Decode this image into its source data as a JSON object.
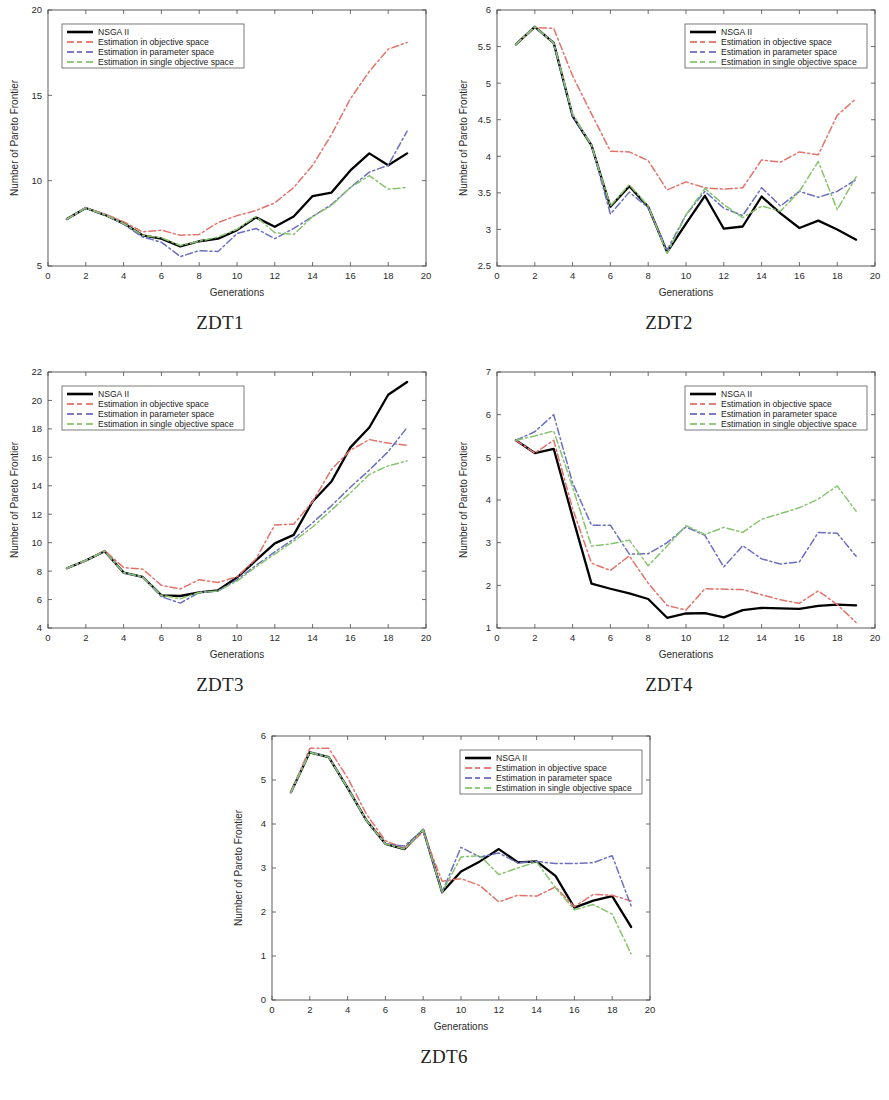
{
  "figure": {
    "axis_label_x": "Generations",
    "axis_label_y": "Number of Pareto Frontier",
    "colors": {
      "nsga2": "#000000",
      "objective": "#e2736b",
      "parameter": "#6b6fc0",
      "single_objective": "#87c46f"
    },
    "legend_entries": [
      "NSGA II",
      "Estimation in objective space",
      "Estimation in parameter space",
      "Estimation in single objective space"
    ]
  },
  "panels": [
    {
      "caption": "ZDT1"
    },
    {
      "caption": "ZDT2"
    },
    {
      "caption": "ZDT3"
    },
    {
      "caption": "ZDT4"
    },
    {
      "caption": "ZDT6"
    }
  ],
  "chart_data": [
    {
      "type": "line",
      "title": "ZDT1",
      "xlabel": "Generations",
      "ylabel": "Number of Pareto Frontier",
      "xlim": [
        0,
        20
      ],
      "ylim": [
        5,
        20
      ],
      "xticks": [
        0,
        2,
        4,
        6,
        8,
        10,
        12,
        14,
        16,
        18,
        20
      ],
      "yticks": [
        5,
        10,
        15,
        20
      ],
      "grid": false,
      "legend_position": "upper-left",
      "x": [
        1,
        2,
        3,
        4,
        5,
        6,
        7,
        8,
        9,
        10,
        11,
        12,
        13,
        14,
        15,
        16,
        17,
        18,
        19
      ],
      "series": [
        {
          "name": "NSGA II",
          "color": "#000000",
          "values": [
            7.75,
            8.4,
            8.0,
            7.5,
            6.8,
            6.6,
            6.15,
            6.45,
            6.6,
            7.1,
            7.85,
            7.3,
            7.9,
            9.1,
            9.3,
            10.6,
            11.6,
            10.9,
            11.6
          ]
        },
        {
          "name": "Estimation in objective space",
          "color": "#e2736b",
          "values": [
            7.75,
            8.4,
            8.05,
            7.6,
            7.0,
            7.1,
            6.8,
            6.85,
            7.55,
            7.95,
            8.25,
            8.7,
            9.6,
            10.9,
            12.7,
            14.8,
            16.4,
            17.7,
            18.1
          ]
        },
        {
          "name": "Estimation in parameter space",
          "color": "#6b6fc0",
          "values": [
            7.75,
            8.4,
            8.0,
            7.45,
            6.7,
            6.4,
            5.55,
            5.9,
            5.85,
            6.9,
            7.2,
            6.6,
            7.2,
            7.9,
            8.6,
            9.6,
            10.5,
            10.9,
            12.9
          ]
        },
        {
          "name": "Estimation in single objective space",
          "color": "#87c46f",
          "values": [
            7.75,
            8.4,
            8.0,
            7.5,
            6.8,
            6.65,
            6.2,
            6.45,
            6.7,
            7.15,
            7.9,
            6.95,
            6.85,
            7.9,
            8.55,
            9.6,
            10.3,
            9.5,
            9.6
          ]
        }
      ]
    },
    {
      "type": "line",
      "title": "ZDT2",
      "xlabel": "Generations",
      "ylabel": "Number of Pareto Frontier",
      "xlim": [
        0,
        20
      ],
      "ylim": [
        2.5,
        6
      ],
      "xticks": [
        0,
        2,
        4,
        6,
        8,
        10,
        12,
        14,
        16,
        18,
        20
      ],
      "yticks": [
        2.5,
        3,
        3.5,
        4,
        4.5,
        5,
        5.5,
        6
      ],
      "grid": false,
      "legend_position": "upper-right",
      "x": [
        1,
        2,
        3,
        4,
        5,
        6,
        7,
        8,
        9,
        10,
        11,
        12,
        13,
        14,
        15,
        16,
        17,
        18,
        19
      ],
      "series": [
        {
          "name": "NSGA II",
          "color": "#000000",
          "values": [
            5.53,
            5.77,
            5.55,
            4.55,
            4.15,
            3.31,
            3.59,
            3.31,
            2.69,
            3.08,
            3.46,
            3.01,
            3.04,
            3.45,
            3.22,
            3.02,
            3.12,
            3.0,
            2.86
          ]
        },
        {
          "name": "Estimation in objective space",
          "color": "#e2736b",
          "values": [
            5.53,
            5.76,
            5.75,
            5.1,
            4.58,
            4.07,
            4.06,
            3.94,
            3.54,
            3.65,
            3.57,
            3.55,
            3.57,
            3.95,
            3.92,
            4.06,
            4.02,
            4.56,
            4.79
          ]
        },
        {
          "name": "Estimation in parameter space",
          "color": "#6b6fc0",
          "values": [
            5.53,
            5.77,
            5.55,
            4.55,
            4.15,
            3.21,
            3.51,
            3.3,
            2.72,
            3.2,
            3.52,
            3.29,
            3.19,
            3.57,
            3.32,
            3.52,
            3.44,
            3.52,
            3.68
          ]
        },
        {
          "name": "Estimation in single objective space",
          "color": "#87c46f",
          "values": [
            5.53,
            5.77,
            5.55,
            4.58,
            4.15,
            3.32,
            3.61,
            3.32,
            2.67,
            3.2,
            3.56,
            3.34,
            3.16,
            3.32,
            3.25,
            3.52,
            3.93,
            3.27,
            3.72
          ]
        }
      ]
    },
    {
      "type": "line",
      "title": "ZDT3",
      "xlabel": "Generations",
      "ylabel": "Number of Pareto Frontier",
      "xlim": [
        0,
        20
      ],
      "ylim": [
        4,
        22
      ],
      "xticks": [
        0,
        2,
        4,
        6,
        8,
        10,
        12,
        14,
        16,
        18,
        20
      ],
      "yticks": [
        4,
        6,
        8,
        10,
        12,
        14,
        16,
        18,
        20,
        22
      ],
      "grid": false,
      "legend_position": "upper-left",
      "x": [
        1,
        2,
        3,
        4,
        5,
        6,
        7,
        8,
        9,
        10,
        11,
        12,
        13,
        14,
        15,
        16,
        17,
        18,
        19
      ],
      "series": [
        {
          "name": "NSGA II",
          "color": "#000000",
          "values": [
            8.2,
            8.75,
            9.4,
            7.9,
            7.6,
            6.3,
            6.25,
            6.5,
            6.65,
            7.55,
            8.75,
            9.95,
            10.55,
            12.9,
            14.3,
            16.7,
            18.1,
            20.4,
            21.3
          ]
        },
        {
          "name": "Estimation in objective space",
          "color": "#e2736b",
          "values": [
            8.2,
            8.75,
            9.45,
            8.25,
            8.15,
            7.0,
            6.75,
            7.4,
            7.2,
            7.6,
            8.85,
            11.25,
            11.3,
            12.9,
            15.15,
            16.5,
            17.25,
            17.0,
            16.85
          ]
        },
        {
          "name": "Estimation in parameter space",
          "color": "#6b6fc0",
          "values": [
            8.2,
            8.75,
            9.4,
            7.85,
            7.6,
            6.2,
            5.75,
            6.5,
            6.6,
            7.4,
            8.4,
            9.35,
            10.25,
            11.4,
            12.6,
            13.9,
            15.1,
            16.4,
            18.1
          ]
        },
        {
          "name": "Estimation in single objective space",
          "color": "#87c46f",
          "values": [
            8.2,
            8.75,
            9.4,
            7.9,
            7.6,
            6.3,
            6.05,
            6.5,
            6.6,
            7.3,
            8.3,
            9.2,
            10.1,
            11.1,
            12.3,
            13.5,
            14.8,
            15.4,
            15.75
          ]
        }
      ]
    },
    {
      "type": "line",
      "title": "ZDT4",
      "xlabel": "Generations",
      "ylabel": "Number of Pareto Frontier",
      "xlim": [
        0,
        20
      ],
      "ylim": [
        1,
        7
      ],
      "xticks": [
        0,
        2,
        4,
        6,
        8,
        10,
        12,
        14,
        16,
        18,
        20
      ],
      "yticks": [
        1,
        2,
        3,
        4,
        5,
        6,
        7
      ],
      "grid": false,
      "legend_position": "upper-right",
      "x": [
        1,
        2,
        3,
        4,
        5,
        6,
        7,
        8,
        9,
        10,
        11,
        12,
        13,
        14,
        15,
        16,
        17,
        18,
        19
      ],
      "series": [
        {
          "name": "NSGA II",
          "color": "#000000",
          "values": [
            5.4,
            5.1,
            5.2,
            3.6,
            2.04,
            1.92,
            1.81,
            1.68,
            1.24,
            1.34,
            1.35,
            1.25,
            1.42,
            1.47,
            1.46,
            1.45,
            1.52,
            1.55,
            1.53
          ]
        },
        {
          "name": "Estimation in objective space",
          "color": "#e2736b",
          "values": [
            5.4,
            5.1,
            5.4,
            3.8,
            2.52,
            2.35,
            2.69,
            2.05,
            1.53,
            1.42,
            1.92,
            1.91,
            1.9,
            1.78,
            1.66,
            1.58,
            1.87,
            1.55,
            1.13
          ]
        },
        {
          "name": "Estimation in parameter space",
          "color": "#6b6fc0",
          "values": [
            5.4,
            5.6,
            6.0,
            4.4,
            3.41,
            3.41,
            2.73,
            2.74,
            3.0,
            3.37,
            3.17,
            2.43,
            2.93,
            2.62,
            2.5,
            2.55,
            3.24,
            3.22,
            2.68
          ]
        },
        {
          "name": "Estimation in single objective space",
          "color": "#87c46f",
          "values": [
            5.4,
            5.5,
            5.62,
            4.3,
            2.92,
            2.97,
            3.06,
            2.46,
            2.92,
            3.4,
            3.19,
            3.36,
            3.24,
            3.55,
            3.68,
            3.82,
            4.02,
            4.33,
            3.74
          ]
        }
      ]
    },
    {
      "type": "line",
      "title": "ZDT6",
      "xlabel": "Generations",
      "ylabel": "Number of Pareto Frontier",
      "xlim": [
        0,
        20
      ],
      "ylim": [
        0,
        6
      ],
      "xticks": [
        0,
        2,
        4,
        6,
        8,
        10,
        12,
        14,
        16,
        18,
        20
      ],
      "yticks": [
        0,
        1,
        2,
        3,
        4,
        5,
        6
      ],
      "grid": false,
      "legend_position": "upper-right",
      "x": [
        1,
        2,
        3,
        4,
        5,
        6,
        7,
        8,
        9,
        10,
        11,
        12,
        13,
        14,
        15,
        16,
        17,
        18,
        19
      ],
      "series": [
        {
          "name": "NSGA II",
          "color": "#000000",
          "values": [
            4.72,
            5.63,
            5.52,
            4.82,
            4.08,
            3.55,
            3.43,
            3.87,
            2.45,
            2.92,
            3.15,
            3.43,
            3.13,
            3.15,
            2.82,
            2.1,
            2.26,
            2.36,
            1.66
          ]
        },
        {
          "name": "Estimation in objective space",
          "color": "#e2736b",
          "values": [
            4.72,
            5.72,
            5.72,
            5.05,
            4.22,
            3.62,
            3.45,
            3.82,
            2.7,
            2.76,
            2.6,
            2.23,
            2.38,
            2.36,
            2.57,
            2.12,
            2.4,
            2.38,
            2.25
          ]
        },
        {
          "name": "Estimation in parameter space",
          "color": "#6b6fc0",
          "values": [
            4.72,
            5.63,
            5.52,
            4.82,
            4.08,
            3.55,
            3.5,
            3.87,
            2.45,
            3.47,
            3.25,
            3.34,
            3.12,
            3.15,
            3.1,
            3.1,
            3.12,
            3.28,
            2.14
          ]
        },
        {
          "name": "Estimation in single objective space",
          "color": "#87c46f",
          "values": [
            4.72,
            5.63,
            5.52,
            4.82,
            4.08,
            3.55,
            3.43,
            3.87,
            2.45,
            3.25,
            3.28,
            2.85,
            3.0,
            3.14,
            2.55,
            2.05,
            2.17,
            1.95,
            1.05
          ]
        }
      ]
    }
  ]
}
